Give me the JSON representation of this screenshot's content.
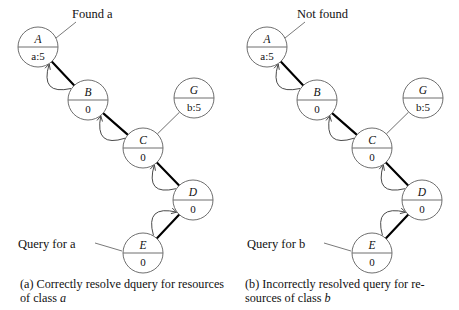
{
  "figure": {
    "type": "diagram"
  },
  "panels": [
    {
      "id": "a",
      "annotations": {
        "top_label": "Found a",
        "query_label": "Query for a"
      },
      "caption": {
        "prefix": "(a) Correctly resolve dquery for resources of class ",
        "italic": "a"
      },
      "nodes": [
        {
          "id": "A",
          "label": "A",
          "value": "a:5",
          "cx": 38,
          "cy": 47,
          "r": 20
        },
        {
          "id": "B",
          "label": "B",
          "value": "0",
          "cx": 88,
          "cy": 100,
          "r": 20
        },
        {
          "id": "C",
          "label": "C",
          "value": "0",
          "cx": 143,
          "cy": 148,
          "r": 20
        },
        {
          "id": "D",
          "label": "D",
          "value": "0",
          "cx": 193,
          "cy": 200,
          "r": 20
        },
        {
          "id": "E",
          "label": "E",
          "value": "0",
          "cx": 143,
          "cy": 253,
          "r": 20
        },
        {
          "id": "G",
          "label": "G",
          "value": "b:5",
          "cx": 194,
          "cy": 98,
          "r": 20
        }
      ],
      "edges": [
        {
          "from": "B",
          "to": "A",
          "style": "thick-with-return-arrow"
        },
        {
          "from": "C",
          "to": "B",
          "style": "thick-with-return-arrow"
        },
        {
          "from": "D",
          "to": "C",
          "style": "thick-with-return-arrow"
        },
        {
          "from": "E",
          "to": "D",
          "style": "thick-with-return-arrow"
        },
        {
          "from": "G",
          "to": "C",
          "style": "plain"
        }
      ]
    },
    {
      "id": "b",
      "annotations": {
        "top_label": "Not found",
        "query_label": "Query for b"
      },
      "caption": {
        "prefix": "(b) Incorrectly resolved query for re-sources of class ",
        "italic": "b"
      },
      "nodes": [
        {
          "id": "A",
          "label": "A",
          "value": "a:5",
          "cx": 38,
          "cy": 47,
          "r": 20
        },
        {
          "id": "B",
          "label": "B",
          "value": "0",
          "cx": 88,
          "cy": 100,
          "r": 20
        },
        {
          "id": "C",
          "label": "C",
          "value": "0",
          "cx": 143,
          "cy": 148,
          "r": 20
        },
        {
          "id": "D",
          "label": "D",
          "value": "0",
          "cx": 193,
          "cy": 200,
          "r": 20
        },
        {
          "id": "E",
          "label": "E",
          "value": "0",
          "cx": 143,
          "cy": 253,
          "r": 20
        },
        {
          "id": "G",
          "label": "G",
          "value": "b:5",
          "cx": 194,
          "cy": 98,
          "r": 20
        }
      ],
      "edges": [
        {
          "from": "B",
          "to": "A",
          "style": "thick-with-return-arrow"
        },
        {
          "from": "C",
          "to": "B",
          "style": "thick-with-return-arrow"
        },
        {
          "from": "D",
          "to": "C",
          "style": "thick-with-return-arrow"
        },
        {
          "from": "E",
          "to": "D",
          "style": "thick-with-return-arrow"
        },
        {
          "from": "G",
          "to": "C",
          "style": "plain"
        }
      ]
    }
  ],
  "colors": {
    "node_stroke": "#6f6f6f",
    "edge_thick": "#000000",
    "edge_curve": "#4a4a4a",
    "text": "#111111",
    "background": "#ffffff"
  }
}
